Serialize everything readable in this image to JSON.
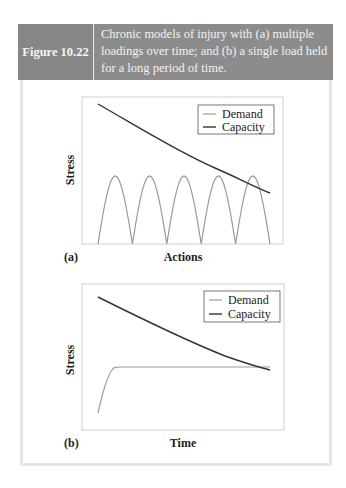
{
  "figure": {
    "number": "Figure 10.22",
    "caption": "Chronic models of injury with (a) multiple loadings over time; and (b) a single load held for a long period of time.",
    "colors": {
      "header_bg": "#8c8c8c",
      "header_text": "#f2f2f2",
      "demand_line": "#9a9a9a",
      "capacity_line": "#333333",
      "panel_border": "#e6e6e6"
    }
  },
  "chart_data": [
    {
      "type": "line",
      "panel_label": "(a)",
      "title": "",
      "xlabel": "Actions",
      "ylabel": "Stress",
      "grid": false,
      "legend_position": "upper right",
      "legend": [
        "Demand",
        "Capacity"
      ],
      "ticks": "none",
      "series": [
        {
          "name": "Demand",
          "description": "Five repeated half-sine loading cycles of equal peak height",
          "cycles": 5,
          "x": [
            0,
            0.5,
            1,
            1.5,
            2,
            2.5,
            3,
            3.5,
            4,
            4.5,
            5
          ],
          "values": [
            0,
            0.55,
            0,
            0.55,
            0,
            0.55,
            0,
            0.55,
            0,
            0.55,
            0
          ]
        },
        {
          "name": "Capacity",
          "description": "Monotonically decreasing tolerance curve",
          "x": [
            0,
            1,
            2,
            3,
            4,
            5
          ],
          "values": [
            0.96,
            0.8,
            0.67,
            0.56,
            0.48,
            0.41
          ]
        }
      ]
    },
    {
      "type": "line",
      "panel_label": "(b)",
      "title": "",
      "xlabel": "Time",
      "ylabel": "Stress",
      "grid": false,
      "legend_position": "upper right",
      "legend": [
        "Demand",
        "Capacity"
      ],
      "ticks": "none",
      "series": [
        {
          "name": "Demand",
          "description": "Rapid rise then constant sustained load",
          "x": [
            0,
            0.25,
            0.5,
            1,
            2,
            3,
            4,
            5
          ],
          "values": [
            0.06,
            0.35,
            0.44,
            0.45,
            0.45,
            0.45,
            0.45,
            0.45
          ]
        },
        {
          "name": "Capacity",
          "description": "Decreasing tolerance curve crossing demand near the end",
          "x": [
            0,
            1,
            2,
            3,
            4,
            5
          ],
          "values": [
            0.91,
            0.8,
            0.68,
            0.58,
            0.5,
            0.43
          ]
        }
      ]
    }
  ]
}
